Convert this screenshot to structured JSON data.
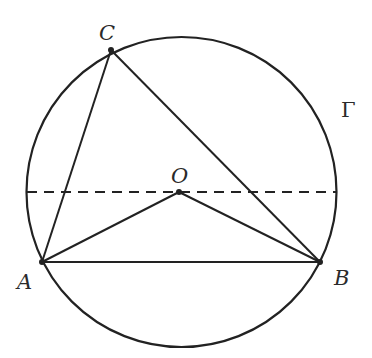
{
  "figure": {
    "circle": {
      "label": "Γ",
      "cx": 181.5,
      "cy": 192,
      "r": 155
    },
    "points": {
      "A": {
        "label": "A",
        "x": 42,
        "y": 262
      },
      "B": {
        "label": "B",
        "x": 320,
        "y": 262
      },
      "C": {
        "label": "C",
        "x": 111,
        "y": 50
      },
      "O": {
        "label": "O",
        "x": 179,
        "y": 192
      }
    },
    "segments": [
      "AB",
      "BC",
      "CA",
      "OA",
      "OB"
    ],
    "dashed_line": {
      "x1": 27,
      "y1": 192,
      "x2": 336,
      "y2": 192
    },
    "colors": {
      "stroke": "#222222",
      "background": "#ffffff"
    }
  }
}
